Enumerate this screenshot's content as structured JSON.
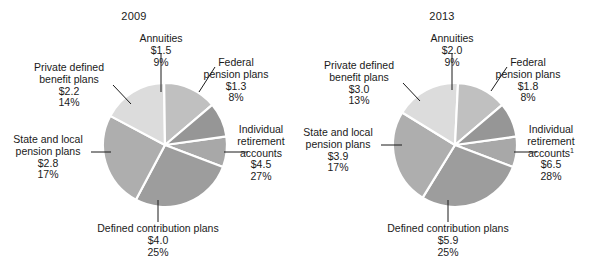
{
  "figure": {
    "background": "#ffffff",
    "text_color": "#1a1a1a"
  },
  "chart_data": [
    {
      "type": "pie",
      "title": "2009",
      "unit": "trillions of dollars",
      "total": 16.3,
      "legend_position": "callout-labels",
      "start_angle_deg": -8,
      "categories": [
        "Federal pension plans",
        "Individual retirement accounts",
        "Defined contribution plans",
        "State and local pension plans",
        "Private defined benefit plans",
        "Annuities"
      ],
      "values": [
        1.3,
        4.5,
        4.0,
        2.8,
        2.2,
        1.5
      ],
      "percents": [
        8,
        27,
        25,
        17,
        14,
        9
      ],
      "value_labels": [
        "$1.3",
        "$4.5",
        "$4.0",
        "$2.8",
        "$2.2",
        "$1.5"
      ],
      "percent_labels": [
        "8%",
        "27%",
        "25%",
        "17%",
        "14%",
        "9%"
      ],
      "colors": [
        "#a8a8a8",
        "#9d9d9d",
        "#aeaeae",
        "#dcdcdc",
        "#c0c0c0",
        "#969696"
      ]
    },
    {
      "type": "pie",
      "title": "2013",
      "unit": "trillions of dollars",
      "total": 23.1,
      "legend_position": "callout-labels",
      "start_angle_deg": -8,
      "categories": [
        "Federal pension plans",
        "Individual retirement accounts",
        "Defined contribution plans",
        "State and local pension plans",
        "Private defined benefit plans",
        "Annuities"
      ],
      "values": [
        1.8,
        6.5,
        5.9,
        3.9,
        3.0,
        2.0
      ],
      "percents": [
        8,
        28,
        25,
        17,
        13,
        9
      ],
      "value_labels": [
        "$1.8",
        "$6.5",
        "$5.9",
        "$3.9",
        "$3.0",
        "$2.0"
      ],
      "percent_labels": [
        "8%",
        "28%",
        "25%",
        "17%",
        "13%",
        "9%"
      ],
      "colors": [
        "#a8a8a8",
        "#9d9d9d",
        "#aeaeae",
        "#dcdcdc",
        "#c0c0c0",
        "#969696"
      ]
    }
  ],
  "panels": {
    "left": {
      "title": "2009",
      "labels": {
        "annuities": {
          "name": "Annuities",
          "value": "$1.5",
          "percent": "9%"
        },
        "federal": {
          "name_line1": "Federal",
          "name_line2": "pension plans",
          "value": "$1.3",
          "percent": "8%"
        },
        "ira": {
          "name_line1": "Individual",
          "name_line2": "retirement",
          "name_line3": "accounts",
          "value": "$4.5",
          "percent": "27%"
        },
        "dc": {
          "name": "Defined contribution plans",
          "value": "$4.0",
          "percent": "25%"
        },
        "state_local": {
          "name_line1": "State and local",
          "name_line2": "pension plans",
          "value": "$2.8",
          "percent": "17%"
        },
        "private_db": {
          "name_line1": "Private defined",
          "name_line2": "benefit plans",
          "value": "$2.2",
          "percent": "14%"
        }
      }
    },
    "right": {
      "title": "2013",
      "labels": {
        "annuities": {
          "name": "Annuities",
          "value": "$2.0",
          "percent": "9%"
        },
        "federal": {
          "name_line1": "Federal",
          "name_line2": "pension plans",
          "value": "$1.8",
          "percent": "8%"
        },
        "ira": {
          "name_line1": "Individual",
          "name_line2": "retirement",
          "name_line3": "accounts",
          "name_line3_footnote": "1",
          "value": "$6.5",
          "percent": "28%"
        },
        "dc": {
          "name": "Defined contribution plans",
          "value": "$5.9",
          "percent": "25%"
        },
        "state_local": {
          "name_line1": "State and local",
          "name_line2": "pension plans",
          "value": "$3.9",
          "percent": "17%"
        },
        "private_db": {
          "name_line1": "Private defined",
          "name_line2": "benefit plans",
          "value": "$3.0",
          "percent": "13%"
        }
      }
    }
  }
}
